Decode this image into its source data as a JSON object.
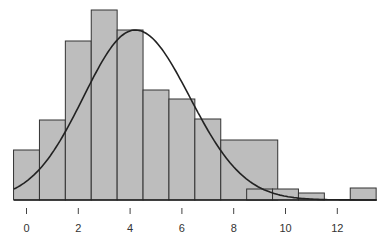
{
  "chart_data": {
    "type": "bar",
    "subtype": "histogram with fitted density curve",
    "title": "",
    "xlabel": "",
    "ylabel": "",
    "x_ticks": [
      "0",
      "2",
      "4",
      "6",
      "8",
      "10",
      "12"
    ],
    "xlim": [
      -0.5,
      13.5
    ],
    "grid": false,
    "legend": null,
    "bins": [
      {
        "x0": -0.5,
        "x1": 0.5,
        "height": 50
      },
      {
        "x0": 0.5,
        "x1": 1.5,
        "height": 80
      },
      {
        "x0": 1.5,
        "x1": 2.5,
        "height": 159
      },
      {
        "x0": 2.5,
        "x1": 3.5,
        "height": 190
      },
      {
        "x0": 3.5,
        "x1": 4.5,
        "height": 170
      },
      {
        "x0": 4.5,
        "x1": 5.5,
        "height": 110
      },
      {
        "x0": 5.5,
        "x1": 6.5,
        "height": 101
      },
      {
        "x0": 6.5,
        "x1": 7.5,
        "height": 81
      },
      {
        "x0": 7.5,
        "x1": 9.7,
        "height": 60
      },
      {
        "x0": 8.5,
        "x1": 9.5,
        "height": 11
      },
      {
        "x0": 9.5,
        "x1": 10.5,
        "height": 11
      },
      {
        "x0": 10.5,
        "x1": 11.5,
        "height": 7
      },
      {
        "x0": 12.5,
        "x1": 13.5,
        "height": 12
      }
    ],
    "curve": {
      "name": "density curve",
      "peak_x": 4.2,
      "peak_height": 170
    },
    "colors": {
      "bar_fill": "#bdbdbd",
      "bar_stroke": "#333333",
      "curve": "#222222"
    }
  }
}
